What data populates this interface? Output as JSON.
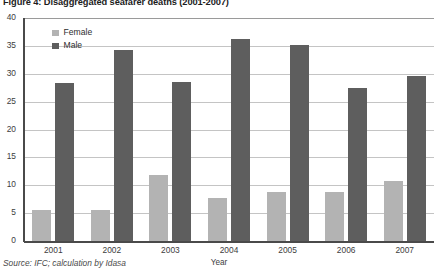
{
  "figure": {
    "title": "Figure 4: Disaggregated seafarer deaths (2001-2007)",
    "source_note": "Source: IFC; calculation by Idasa"
  },
  "legend": {
    "position": "top-left-inside",
    "entries": [
      {
        "label": "Female",
        "color": "#b3b3b3"
      },
      {
        "label": "Male",
        "color": "#5e5e5e"
      }
    ]
  },
  "axes": {
    "x_title": "Year",
    "y_title": "",
    "y_ticks": [
      "0",
      "5",
      "10",
      "15",
      "20",
      "25",
      "30",
      "35",
      "40"
    ]
  },
  "chart_data": {
    "type": "bar",
    "title": "Figure 4: Disaggregated seafarer deaths (2001-2007)",
    "xlabel": "Year",
    "ylabel": "",
    "ylim": [
      0,
      40
    ],
    "ytick_step": 5,
    "grid": true,
    "legend_position": "top-left-inside",
    "categories": [
      "2001",
      "2002",
      "2003",
      "2004",
      "2005",
      "2006",
      "2007"
    ],
    "series": [
      {
        "name": "Female",
        "color": "#b3b3b3",
        "values": [
          5.5,
          5.5,
          11.8,
          7.8,
          8.8,
          8.8,
          10.7
        ]
      },
      {
        "name": "Male",
        "color": "#5e5e5e",
        "values": [
          28.3,
          34.2,
          28.5,
          36.3,
          35.2,
          27.5,
          29.6
        ]
      }
    ]
  }
}
